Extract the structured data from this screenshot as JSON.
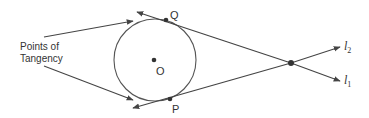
{
  "diagram": {
    "annotation": {
      "line1": "Points of",
      "line2": "Tangency"
    },
    "labels": {
      "center": "O",
      "tangent_point_top": "Q",
      "tangent_point_bottom": "P",
      "line_top_label": "l",
      "line_top_subscript": "2",
      "line_bottom_label": "l",
      "line_bottom_subscript": "1"
    },
    "colors": {
      "stroke": "#444444",
      "text": "#333333",
      "background": "#ffffff"
    }
  }
}
